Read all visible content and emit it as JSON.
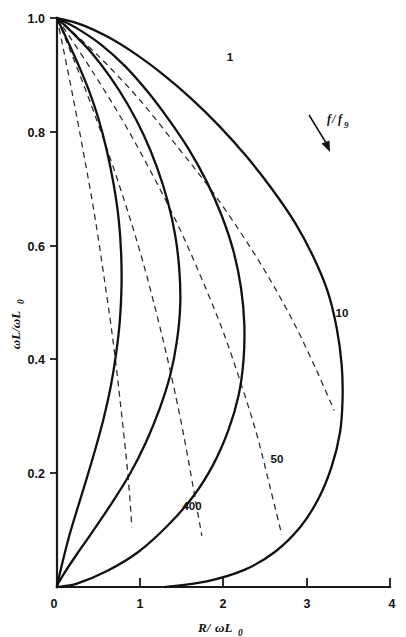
{
  "figure": {
    "title": "",
    "background_color": "#ffffff",
    "curve_color": "#111111",
    "dashed_color": "#2a2a2a",
    "axis_color": "#1a1a1a"
  },
  "axes": {
    "x": {
      "label_main": "R/",
      "label_omega": "ωL",
      "label_sub": "0",
      "full_label": "R/ωL0",
      "ticks": [
        "0",
        "1",
        "2",
        "3",
        "4"
      ],
      "min": 0,
      "max": 4
    },
    "y": {
      "label_main": "ωL/ωL",
      "label_sub": "0",
      "full_label": "ωL/ωL0",
      "ticks": [
        "0",
        "0.2",
        "0.4",
        "0.6",
        "0.8",
        "1.0"
      ],
      "min": 0,
      "max": 1.0
    }
  },
  "annotations": {
    "ratio_label_num": "f",
    "ratio_label_slash": "/",
    "ratio_label_den": "f",
    "ratio_label_sub": "9",
    "ratio_label_full": "f/f9",
    "arrow": "arrow-down-right"
  },
  "curve_labels": {
    "c1": "1",
    "c10": "10",
    "c50": "50",
    "c400": "400"
  },
  "chart_data": {
    "type": "line",
    "title": "",
    "xlabel": "R/ωL0",
    "ylabel": "ωL/ωL0",
    "xlim": [
      0,
      4
    ],
    "ylim": [
      0,
      1.0
    ],
    "xticks": [
      0,
      1,
      2,
      3,
      4
    ],
    "yticks": [
      0,
      0.2,
      0.4,
      0.6,
      0.8,
      1.0
    ],
    "grid": false,
    "legend": "inline-curve-labels",
    "annotations": [
      {
        "text": "f/f9",
        "x": 2.95,
        "y": 0.79,
        "note": "parameter increases in arrow direction"
      }
    ],
    "series": [
      {
        "name": "1",
        "style": "solid",
        "label_position": {
          "x": 2.08,
          "y": 0.933
        },
        "points": [
          {
            "x": 0.0,
            "y": 1.0
          },
          {
            "x": 0.3,
            "y": 0.988
          },
          {
            "x": 0.62,
            "y": 0.966
          },
          {
            "x": 0.95,
            "y": 0.936
          },
          {
            "x": 1.28,
            "y": 0.9
          },
          {
            "x": 1.6,
            "y": 0.86
          },
          {
            "x": 1.95,
            "y": 0.81
          },
          {
            "x": 2.28,
            "y": 0.756
          },
          {
            "x": 2.58,
            "y": 0.7
          },
          {
            "x": 2.86,
            "y": 0.64
          },
          {
            "x": 3.08,
            "y": 0.58
          },
          {
            "x": 3.25,
            "y": 0.52
          },
          {
            "x": 3.36,
            "y": 0.455
          },
          {
            "x": 3.42,
            "y": 0.39
          },
          {
            "x": 3.43,
            "y": 0.33
          },
          {
            "x": 3.4,
            "y": 0.272
          },
          {
            "x": 3.3,
            "y": 0.212
          },
          {
            "x": 3.14,
            "y": 0.155
          },
          {
            "x": 2.92,
            "y": 0.105
          },
          {
            "x": 2.62,
            "y": 0.062
          },
          {
            "x": 2.25,
            "y": 0.03
          },
          {
            "x": 1.8,
            "y": 0.01
          },
          {
            "x": 1.3,
            "y": 0.0
          }
        ]
      },
      {
        "name": "10",
        "style": "solid",
        "label_position": {
          "x": 3.42,
          "y": 0.485
        },
        "points": [
          {
            "x": 0.0,
            "y": 1.0
          },
          {
            "x": 0.26,
            "y": 0.98
          },
          {
            "x": 0.54,
            "y": 0.952
          },
          {
            "x": 0.82,
            "y": 0.915
          },
          {
            "x": 1.08,
            "y": 0.872
          },
          {
            "x": 1.33,
            "y": 0.824
          },
          {
            "x": 1.58,
            "y": 0.77
          },
          {
            "x": 1.8,
            "y": 0.712
          },
          {
            "x": 1.98,
            "y": 0.652
          },
          {
            "x": 2.12,
            "y": 0.59
          },
          {
            "x": 2.21,
            "y": 0.526
          },
          {
            "x": 2.25,
            "y": 0.462
          },
          {
            "x": 2.24,
            "y": 0.398
          },
          {
            "x": 2.18,
            "y": 0.336
          },
          {
            "x": 2.06,
            "y": 0.276
          },
          {
            "x": 1.88,
            "y": 0.216
          },
          {
            "x": 1.64,
            "y": 0.16
          },
          {
            "x": 1.33,
            "y": 0.108
          },
          {
            "x": 0.98,
            "y": 0.062
          },
          {
            "x": 0.6,
            "y": 0.028
          },
          {
            "x": 0.24,
            "y": 0.006
          },
          {
            "x": 0.0,
            "y": 0.0
          }
        ]
      },
      {
        "name": "50",
        "style": "solid",
        "label_position": {
          "x": 2.66,
          "y": 0.232
        },
        "points": [
          {
            "x": 0.0,
            "y": 1.0
          },
          {
            "x": 0.2,
            "y": 0.972
          },
          {
            "x": 0.42,
            "y": 0.938
          },
          {
            "x": 0.64,
            "y": 0.896
          },
          {
            "x": 0.85,
            "y": 0.848
          },
          {
            "x": 1.04,
            "y": 0.795
          },
          {
            "x": 1.2,
            "y": 0.738
          },
          {
            "x": 1.33,
            "y": 0.678
          },
          {
            "x": 1.42,
            "y": 0.618
          },
          {
            "x": 1.47,
            "y": 0.556
          },
          {
            "x": 1.48,
            "y": 0.494
          },
          {
            "x": 1.44,
            "y": 0.432
          },
          {
            "x": 1.36,
            "y": 0.372
          },
          {
            "x": 1.23,
            "y": 0.312
          },
          {
            "x": 1.07,
            "y": 0.255
          },
          {
            "x": 0.88,
            "y": 0.2
          },
          {
            "x": 0.66,
            "y": 0.148
          },
          {
            "x": 0.44,
            "y": 0.1
          },
          {
            "x": 0.24,
            "y": 0.058
          },
          {
            "x": 0.09,
            "y": 0.025
          },
          {
            "x": 0.0,
            "y": 0.003
          }
        ]
      },
      {
        "name": "400",
        "style": "solid",
        "label_position": {
          "x": 1.6,
          "y": 0.115
        },
        "points": [
          {
            "x": 0.0,
            "y": 1.0
          },
          {
            "x": 0.12,
            "y": 0.962
          },
          {
            "x": 0.25,
            "y": 0.92
          },
          {
            "x": 0.38,
            "y": 0.874
          },
          {
            "x": 0.5,
            "y": 0.822
          },
          {
            "x": 0.6,
            "y": 0.766
          },
          {
            "x": 0.68,
            "y": 0.708
          },
          {
            "x": 0.74,
            "y": 0.648
          },
          {
            "x": 0.77,
            "y": 0.588
          },
          {
            "x": 0.775,
            "y": 0.528
          },
          {
            "x": 0.755,
            "y": 0.468
          },
          {
            "x": 0.71,
            "y": 0.41
          },
          {
            "x": 0.645,
            "y": 0.352
          },
          {
            "x": 0.56,
            "y": 0.296
          },
          {
            "x": 0.46,
            "y": 0.242
          },
          {
            "x": 0.355,
            "y": 0.19
          },
          {
            "x": 0.25,
            "y": 0.14
          },
          {
            "x": 0.155,
            "y": 0.094
          },
          {
            "x": 0.08,
            "y": 0.052
          },
          {
            "x": 0.025,
            "y": 0.018
          },
          {
            "x": 0.0,
            "y": 0.0
          }
        ]
      }
    ],
    "dashed_series": [
      {
        "name": "locus-a",
        "style": "dashed",
        "points": [
          {
            "x": 0.0,
            "y": 1.0
          },
          {
            "x": 0.52,
            "y": 0.93
          },
          {
            "x": 1.0,
            "y": 0.855
          },
          {
            "x": 1.44,
            "y": 0.775
          },
          {
            "x": 1.84,
            "y": 0.7
          },
          {
            "x": 2.22,
            "y": 0.62
          },
          {
            "x": 2.56,
            "y": 0.54
          },
          {
            "x": 2.86,
            "y": 0.46
          },
          {
            "x": 3.12,
            "y": 0.38
          },
          {
            "x": 3.33,
            "y": 0.31
          }
        ]
      },
      {
        "name": "locus-b",
        "style": "dashed",
        "points": [
          {
            "x": 0.0,
            "y": 1.0
          },
          {
            "x": 0.4,
            "y": 0.912
          },
          {
            "x": 0.78,
            "y": 0.822
          },
          {
            "x": 1.12,
            "y": 0.732
          },
          {
            "x": 1.44,
            "y": 0.64
          },
          {
            "x": 1.72,
            "y": 0.548
          },
          {
            "x": 1.98,
            "y": 0.455
          },
          {
            "x": 2.2,
            "y": 0.362
          },
          {
            "x": 2.4,
            "y": 0.268
          },
          {
            "x": 2.56,
            "y": 0.175
          },
          {
            "x": 2.7,
            "y": 0.092
          }
        ]
      },
      {
        "name": "locus-c",
        "style": "dashed",
        "points": [
          {
            "x": 0.0,
            "y": 1.0
          },
          {
            "x": 0.28,
            "y": 0.898
          },
          {
            "x": 0.54,
            "y": 0.795
          },
          {
            "x": 0.78,
            "y": 0.692
          },
          {
            "x": 1.0,
            "y": 0.588
          },
          {
            "x": 1.19,
            "y": 0.484
          },
          {
            "x": 1.36,
            "y": 0.38
          },
          {
            "x": 1.51,
            "y": 0.276
          },
          {
            "x": 1.64,
            "y": 0.172
          },
          {
            "x": 1.74,
            "y": 0.09
          }
        ]
      },
      {
        "name": "locus-d",
        "style": "dashed",
        "points": [
          {
            "x": 0.0,
            "y": 1.0
          },
          {
            "x": 0.16,
            "y": 0.885
          },
          {
            "x": 0.31,
            "y": 0.77
          },
          {
            "x": 0.45,
            "y": 0.655
          },
          {
            "x": 0.57,
            "y": 0.54
          },
          {
            "x": 0.68,
            "y": 0.425
          },
          {
            "x": 0.77,
            "y": 0.312
          },
          {
            "x": 0.85,
            "y": 0.2
          },
          {
            "x": 0.9,
            "y": 0.105
          }
        ]
      }
    ]
  }
}
